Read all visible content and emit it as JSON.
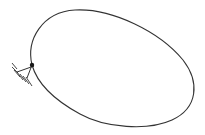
{
  "diagram": {
    "type": "mechanics-sketch",
    "colors": {
      "background": "#ffffff",
      "stroke": "#333333",
      "pin": "#1a1a1a"
    },
    "loop": {
      "path": "M32,65 C26,40 42,12 75,10 C112,8 160,32 183,60 C200,82 198,108 172,120 C148,131 105,128 80,114 C56,101 38,86 32,65 Z"
    },
    "pin": {
      "x": 32,
      "y": 65,
      "r": 2.2
    },
    "support": {
      "base": {
        "x1": 17,
        "y1": 72,
        "x2": 34,
        "y2": 66
      },
      "strut": {
        "x1": 32,
        "y1": 65,
        "x2": 27,
        "y2": 78
      },
      "hatches": [
        {
          "x1": 12,
          "y1": 63,
          "x2": 17,
          "y2": 69
        },
        {
          "x1": 12,
          "y1": 67,
          "x2": 18,
          "y2": 73
        },
        {
          "x1": 14,
          "y1": 70,
          "x2": 20,
          "y2": 77
        },
        {
          "x1": 17,
          "y1": 72,
          "x2": 23,
          "y2": 80
        },
        {
          "x1": 20,
          "y1": 74,
          "x2": 26,
          "y2": 82
        },
        {
          "x1": 23,
          "y1": 76,
          "x2": 29,
          "y2": 84
        },
        {
          "x1": 26,
          "y1": 77,
          "x2": 32,
          "y2": 86
        }
      ]
    }
  }
}
